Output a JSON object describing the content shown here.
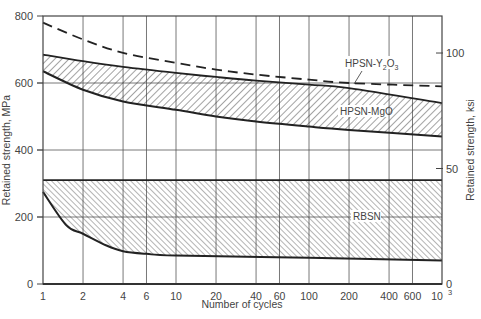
{
  "chart_data": {
    "type": "area",
    "title": "",
    "xlabel": "Number of cycles",
    "ylabel": "Retained strength, MPa",
    "ylabel_right": "Retained strength, ksi",
    "xscale": "log",
    "xlim": [
      1,
      1000
    ],
    "ylim": [
      0,
      800
    ],
    "ylim_right_ksi": [
      0,
      116
    ],
    "grid": true,
    "x_ticks": [
      1,
      2,
      4,
      6,
      10,
      20,
      40,
      60,
      100,
      200,
      400,
      600,
      1000
    ],
    "x_tick_labels": [
      "1",
      "2",
      "4",
      "6",
      "10",
      "20",
      "40",
      "60",
      "100",
      "200",
      "400",
      "600",
      "10³"
    ],
    "y_ticks": [
      0,
      200,
      400,
      600,
      800
    ],
    "y_tick_labels": [
      "0",
      "200",
      "400",
      "600",
      "800"
    ],
    "y_right_ticks_ksi": [
      0,
      50,
      100
    ],
    "y_right_tick_labels": [
      "0",
      "50",
      "100"
    ],
    "series": [
      {
        "name": "HPSN-Y2O3",
        "style": "dashed-line",
        "x": [
          1,
          2,
          4,
          10,
          20,
          40,
          100,
          200,
          1000
        ],
        "values": [
          780,
          730,
          690,
          660,
          640,
          625,
          610,
          600,
          590
        ]
      },
      {
        "name": "HPSN-MgO",
        "style": "hatched-band",
        "x": [
          1,
          2,
          4,
          10,
          20,
          40,
          100,
          200,
          1000
        ],
        "upper": [
          685,
          665,
          648,
          630,
          618,
          607,
          595,
          585,
          540
        ],
        "lower": [
          635,
          580,
          545,
          520,
          500,
          485,
          470,
          460,
          440
        ]
      },
      {
        "name": "RBSN",
        "style": "hatched-band",
        "x": [
          1,
          1.5,
          2,
          3,
          4,
          6,
          10,
          100,
          1000
        ],
        "upper": [
          310,
          310,
          310,
          310,
          310,
          310,
          310,
          310,
          310
        ],
        "lower": [
          275,
          175,
          150,
          115,
          98,
          90,
          85,
          78,
          70
        ]
      }
    ],
    "annotations": [
      {
        "text": "HPSN-Y",
        "sub": "2",
        "text2": "O",
        "sub2": "3",
        "x": 300,
        "y": 680
      },
      {
        "text": "HPSN-MgO",
        "x": 400,
        "y": 520
      },
      {
        "text": "RBSN",
        "x": 180,
        "y": 200
      }
    ]
  }
}
